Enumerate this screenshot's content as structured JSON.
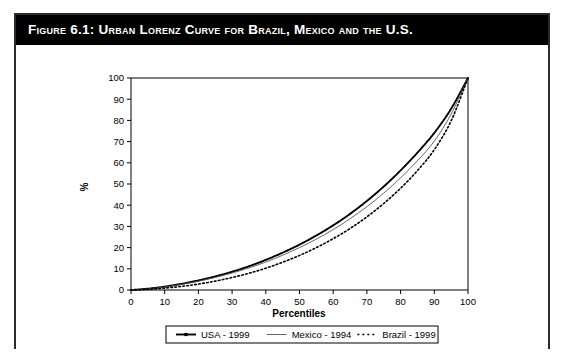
{
  "figure": {
    "label": "FIGURE 6.1:",
    "title": "Urban Lorenz Curve for Brazil, Mexico and the U.S.",
    "full_title": "Figure 6.1:  Urban Lorenz Curve for Brazil, Mexico and the U.S.",
    "banner_color": "#000000",
    "banner_text_color": "#ffffff",
    "border_color": "#2b2b2b",
    "background_color": "#ffffff"
  },
  "chart_data": {
    "type": "line",
    "title": "Urban Lorenz Curve for Brazil, Mexico and the U.S.",
    "xlabel": "Percentiles",
    "ylabel": "%",
    "xlim": [
      0,
      100
    ],
    "ylim": [
      0,
      100
    ],
    "xticks": [
      0,
      10,
      20,
      30,
      40,
      50,
      60,
      70,
      80,
      90,
      100
    ],
    "yticks": [
      0,
      10,
      20,
      30,
      40,
      50,
      60,
      70,
      80,
      90,
      100
    ],
    "grid": false,
    "legend_position": "below-axis",
    "x": [
      0,
      5,
      10,
      15,
      20,
      25,
      30,
      35,
      40,
      45,
      50,
      55,
      60,
      65,
      70,
      75,
      80,
      85,
      90,
      95,
      100
    ],
    "series": [
      {
        "name": "USA - 1999",
        "style": "line-with-markers",
        "color": "#000000",
        "line_width": 1.9,
        "marker": "small-dash",
        "values": [
          0,
          0.6,
          1.6,
          2.9,
          4.5,
          6.4,
          8.6,
          11.2,
          14.2,
          17.6,
          21.4,
          25.7,
          30.5,
          35.9,
          42.0,
          48.8,
          56.4,
          64.8,
          74.1,
          85.5,
          100
        ]
      },
      {
        "name": "Mexico - 1994",
        "style": "solid-thin",
        "color": "#555555",
        "line_width": 0.9,
        "marker": "none",
        "values": [
          0,
          0.5,
          1.4,
          2.6,
          4.1,
          5.9,
          8.0,
          10.4,
          13.2,
          16.4,
          20.0,
          24.0,
          28.5,
          33.6,
          39.3,
          45.7,
          52.9,
          61.0,
          70.2,
          83.0,
          100
        ]
      },
      {
        "name": "Brazil - 1999",
        "style": "dotted",
        "color": "#000000",
        "line_width": 1.6,
        "marker": "dots",
        "values": [
          0,
          0.3,
          0.9,
          1.7,
          2.8,
          4.2,
          5.9,
          7.9,
          10.3,
          13.1,
          16.3,
          20.0,
          24.2,
          29.0,
          34.5,
          40.8,
          48.0,
          56.3,
          66.2,
          79.8,
          100
        ]
      }
    ]
  },
  "legend": {
    "items": [
      {
        "label": "USA - 1999",
        "marker_type": "line-marker"
      },
      {
        "label": "Mexico - 1994",
        "marker_type": "line"
      },
      {
        "label": "Brazil - 1999",
        "marker_type": "dotted"
      }
    ]
  }
}
